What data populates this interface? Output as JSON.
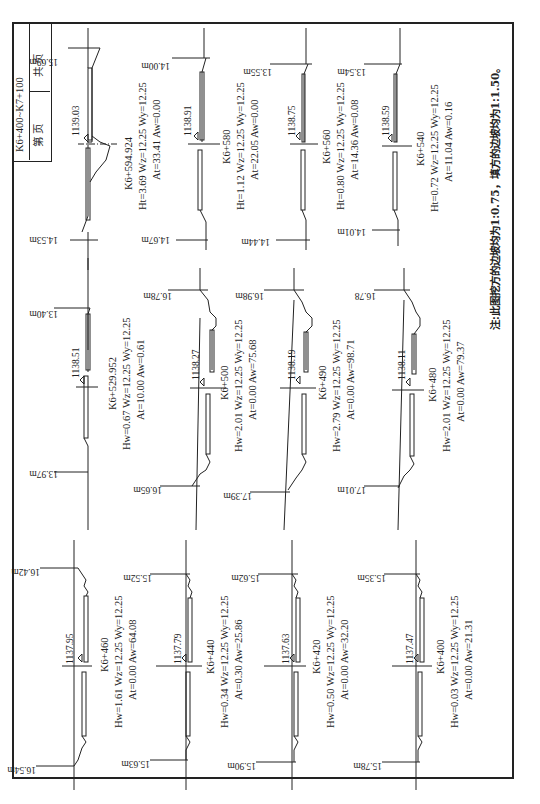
{
  "title_block": {
    "range": "K6+400~K7+100",
    "page_label": "第   页",
    "total_label": "共   页"
  },
  "note": "注:此图挖方的边坡均为1:0.75，填方的边坡均为1:1.50。",
  "sections": [
    {
      "station": "K6+594.924",
      "design_elev": "1139.03",
      "left_width": "14.53m",
      "right_width": "15.69m",
      "H_label": "Ht",
      "H": "3.69",
      "Wz": "12.25",
      "Wy": "12.25",
      "At": "33.41",
      "Aw": "0.00",
      "line1": "K6+594.924",
      "line2": "Ht=3.69  Wz=12.25  Wy=12.25",
      "line3": "At=33.41  Aw=0.00"
    },
    {
      "station": "K6+580",
      "design_elev": "1138.91",
      "left_width": "14.67m",
      "right_width": "14.00m",
      "H_label": "Ht",
      "H": "1.12",
      "Wz": "12.25",
      "Wy": "12.25",
      "At": "22.05",
      "Aw": "0.00",
      "line1": "K6+580",
      "line2": "Ht=1.12  Wz=12.25  Wy=12.25",
      "line3": "At=22.05  Aw=0.00"
    },
    {
      "station": "K6+560",
      "design_elev": "1138.75",
      "left_width": "14.44m",
      "right_width": "13.55m",
      "H_label": "Ht",
      "H": "0.80",
      "Wz": "12.25",
      "Wy": "12.25",
      "At": "14.36",
      "Aw": "0.08",
      "line1": "K6+560",
      "line2": "Ht=0.80  Wz=12.25  Wy=12.25",
      "line3": "At=14.36  Aw=0.08"
    },
    {
      "station": "K6+540",
      "design_elev": "1138.59",
      "left_width": "14.01m",
      "right_width": "13.54m",
      "H_label": "Ht",
      "H": "0.72",
      "Wz": "12.25",
      "Wy": "12.25",
      "At": "11.04",
      "Aw": "0.16",
      "line1": "K6+540",
      "line2": "Ht=0.72  Wz=12.25  Wy=12.25",
      "line3": "At=11.04  Aw=0.16"
    },
    {
      "station": "K6+529.952",
      "design_elev": "1138.51",
      "left_width": "13.97m",
      "right_width": "13.40m",
      "H_label": "Hw",
      "H": "0.67",
      "Wz": "12.25",
      "Wy": "12.25",
      "At": "10.00",
      "Aw": "0.61",
      "line1": "K6+529.952",
      "line2": "Hw=0.67  Wz=12.25  Wy=12.25",
      "line3": "At=10.00  Aw=0.61"
    },
    {
      "station": "K6+500",
      "design_elev": "1138.27",
      "left_width": "16.65m",
      "right_width": "16.78m",
      "H_label": "Hw",
      "H": "2.01",
      "Wz": "12.25",
      "Wy": "12.25",
      "At": "0.00",
      "Aw": "75.68",
      "line1": "K6+500",
      "line2": "Hw=2.01  Wz=12.25  Wy=12.25",
      "line3": "At=0.00  Aw=75.68"
    },
    {
      "station": "K6+490",
      "design_elev": "1138.19",
      "left_width": "17.39m",
      "right_width": "16.98m",
      "H_label": "Hw",
      "H": "2.79",
      "Wz": "12.25",
      "Wy": "12.25",
      "At": "0.00",
      "Aw": "98.71",
      "line1": "K6+490",
      "line2": "Hw=2.79  Wz=12.25  Wy=12.25",
      "line3": "At=0.00  Aw=98.71"
    },
    {
      "station": "K6+480",
      "design_elev": "1138.11",
      "left_width": "17.01m",
      "right_width": "16.78",
      "H_label": "Hw",
      "H": "2.01",
      "Wz": "12.25",
      "Wy": "12.25",
      "At": "0.00",
      "Aw": "79.37",
      "line1": "K6+480",
      "line2": "Hw=2.01  Wz=12.25  Wy=12.25",
      "line3": "At=0.00  Aw=79.37"
    },
    {
      "station": "K6+460",
      "design_elev": "1137.95",
      "left_width": "16.54m",
      "right_width": "16.42m",
      "H_label": "Hw",
      "H": "1.61",
      "Wz": "12.25",
      "Wy": "12.25",
      "At": "0.00",
      "Aw": "64.08",
      "line1": "K6+460",
      "line2": "Hw=1.61  Wz=12.25  Wy=12.25",
      "line3": "At=0.00  Aw=64.08"
    },
    {
      "station": "K6+440",
      "design_elev": "1137.79",
      "left_width": "15.63m",
      "right_width": "15.52m",
      "H_label": "Hw",
      "H": "0.34",
      "Wz": "12.25",
      "Wy": "12.25",
      "At": "0.30",
      "Aw": "25.86",
      "line1": "K6+440",
      "line2": "Hw=0.34  Wz=12.25  Wy=12.25",
      "line3": "At=0.30  Aw=25.86"
    },
    {
      "station": "K6+420",
      "design_elev": "1137.63",
      "left_width": "15.90m",
      "right_width": "15.62m",
      "H_label": "Hw",
      "H": "0.50",
      "Wz": "12.25",
      "Wy": "12.25",
      "At": "0.00",
      "Aw": "32.20",
      "line1": "K6+420",
      "line2": "Hw=0.50  Wz=12.25  Wy=12.25",
      "line3": "At=0.00  Aw=32.20"
    },
    {
      "station": "K6+400",
      "design_elev": "1137.47",
      "left_width": "15.78m",
      "right_width": "15.35m",
      "H_label": "Hw",
      "H": "0.03",
      "Wz": "12.25",
      "Wy": "12.25",
      "At": "0.00",
      "Aw": "21.31",
      "line1": "K6+400",
      "line2": "Hw=0.03  Wz=12.25  Wy=12.25",
      "line3": "At=0.00  Aw=21.31"
    }
  ],
  "colors": {
    "ink": "#222222",
    "paper": "#ffffff"
  }
}
